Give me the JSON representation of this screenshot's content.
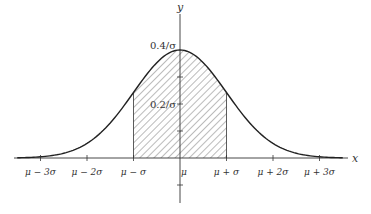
{
  "figure": {
    "x_axis_label": "x",
    "y_axis_label": "y",
    "x_tick_labels": [
      "μ − 3σ",
      "μ − 2σ",
      "μ − σ",
      "μ",
      "μ + σ",
      "μ + 2σ",
      "μ + 3σ"
    ],
    "x_tick_values_in_sigma": [
      -3,
      -2,
      -1,
      0,
      1,
      2,
      3
    ],
    "y_tick_labels": [
      "0.4/σ",
      "0.2/σ"
    ],
    "y_tick_values": [
      0.4,
      0.2
    ],
    "shaded_region": {
      "from_sigma": -1,
      "to_sigma": 1,
      "fill": "diagonal-hatch"
    },
    "curve": "standard normal density",
    "x_range_sigma": [
      -3.5,
      3.5
    ],
    "colors": {
      "line": "#222222",
      "hatch": "#555555",
      "background": "#ffffff"
    }
  }
}
